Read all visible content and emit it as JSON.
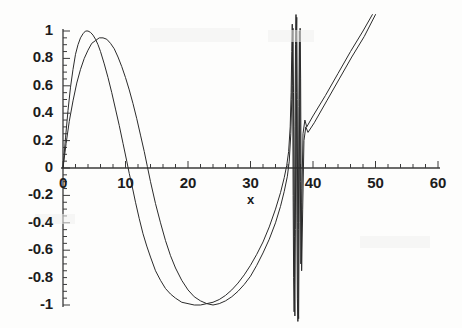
{
  "chart_data": {
    "type": "line",
    "title": "",
    "xlabel": "x",
    "ylabel": "",
    "xlim": [
      -2,
      62
    ],
    "ylim": [
      -1.12,
      1.12
    ],
    "grid": false,
    "legend": null,
    "x_ticks_major": [
      0,
      10,
      20,
      30,
      40,
      50,
      60
    ],
    "x_tick_labels": [
      "0",
      "10",
      "20",
      "30",
      "40",
      "50",
      "60"
    ],
    "x_tick_minor_step": 2,
    "y_ticks_major": [
      1,
      0.8,
      0.6,
      0.4,
      0.2,
      0,
      -0.2,
      -0.4,
      -0.6,
      -0.8,
      -1
    ],
    "y_tick_labels": [
      "1",
      "0.8",
      "0.6",
      "0.4",
      "0.2",
      "0",
      "-0.2",
      "-0.4",
      "-0.6",
      "-0.8",
      "-1"
    ],
    "y_tick_minor_step": 0.05,
    "line_color": "#2b2b2b",
    "line_width": 1.0,
    "axis_color": "#3a3a3a",
    "background_color": "#fdfdfc",
    "series": [
      {
        "name": "curve-1",
        "comment": "chirped oscillation, peaks at 1.00 near x=4.6, trough -1.00 near x=22.5, frequency diverges near x=36-38",
        "points": [
          [
            0.0,
            0.0
          ],
          [
            0.4,
            0.22
          ],
          [
            0.8,
            0.42
          ],
          [
            1.2,
            0.59
          ],
          [
            1.6,
            0.72
          ],
          [
            2.0,
            0.83
          ],
          [
            2.4,
            0.9
          ],
          [
            2.8,
            0.95
          ],
          [
            3.2,
            0.98
          ],
          [
            3.6,
            1.0
          ],
          [
            4.0,
            1.0
          ],
          [
            4.4,
            0.99
          ],
          [
            4.8,
            0.97
          ],
          [
            5.2,
            0.94
          ],
          [
            5.6,
            0.9
          ],
          [
            6.0,
            0.85
          ],
          [
            6.6,
            0.76
          ],
          [
            7.2,
            0.66
          ],
          [
            7.8,
            0.55
          ],
          [
            8.4,
            0.43
          ],
          [
            9.0,
            0.31
          ],
          [
            9.6,
            0.18
          ],
          [
            10.2,
            0.05
          ],
          [
            10.6,
            -0.04
          ],
          [
            11.0,
            -0.12
          ],
          [
            11.6,
            -0.25
          ],
          [
            12.2,
            -0.37
          ],
          [
            12.8,
            -0.48
          ],
          [
            13.4,
            -0.57
          ],
          [
            14.0,
            -0.65
          ],
          [
            14.8,
            -0.75
          ],
          [
            15.6,
            -0.82
          ],
          [
            16.4,
            -0.88
          ],
          [
            17.2,
            -0.92
          ],
          [
            18.0,
            -0.95
          ],
          [
            19.0,
            -0.98
          ],
          [
            20.0,
            -0.99
          ],
          [
            21.0,
            -1.0
          ],
          [
            22.0,
            -1.0
          ],
          [
            23.0,
            -0.99
          ],
          [
            24.0,
            -0.98
          ],
          [
            25.0,
            -0.96
          ],
          [
            26.0,
            -0.93
          ],
          [
            27.0,
            -0.89
          ],
          [
            28.0,
            -0.84
          ],
          [
            29.0,
            -0.78
          ],
          [
            30.0,
            -0.71
          ],
          [
            31.0,
            -0.63
          ],
          [
            32.0,
            -0.54
          ],
          [
            33.0,
            -0.43
          ],
          [
            34.0,
            -0.3
          ],
          [
            34.8,
            -0.18
          ],
          [
            35.4,
            -0.07
          ],
          [
            35.8,
            0.02
          ],
          [
            36.1,
            0.12
          ],
          [
            36.35,
            0.3
          ],
          [
            36.5,
            0.55
          ],
          [
            36.6,
            0.85
          ],
          [
            36.68,
            1.05
          ],
          [
            36.75,
            0.6
          ],
          [
            36.82,
            -0.2
          ],
          [
            36.9,
            -0.8
          ],
          [
            36.98,
            -1.05
          ],
          [
            37.05,
            -0.5
          ],
          [
            37.12,
            0.3
          ],
          [
            37.2,
            0.9
          ],
          [
            37.28,
            1.12
          ],
          [
            37.35,
            0.55
          ],
          [
            37.42,
            -0.35
          ],
          [
            37.5,
            -0.95
          ],
          [
            37.58,
            -1.12
          ],
          [
            37.66,
            -0.45
          ],
          [
            37.74,
            0.45
          ],
          [
            37.82,
            1.0
          ],
          [
            37.9,
            0.7
          ],
          [
            37.98,
            -0.1
          ],
          [
            38.06,
            -0.7
          ],
          [
            38.2,
            -0.25
          ],
          [
            38.4,
            0.25
          ],
          [
            38.7,
            0.35
          ],
          [
            39.0,
            0.3
          ],
          [
            40.0,
            0.38
          ],
          [
            42.0,
            0.53
          ],
          [
            44.0,
            0.69
          ],
          [
            46.0,
            0.85
          ],
          [
            48.0,
            1.0
          ],
          [
            49.5,
            1.12
          ]
        ]
      },
      {
        "name": "curve-2",
        "comment": "companion curve, slightly phase-shifted, peak 0.95 near x=6.2, trough -1.00 near x=23.5",
        "points": [
          [
            0.0,
            0.0
          ],
          [
            0.5,
            0.18
          ],
          [
            1.0,
            0.34
          ],
          [
            1.6,
            0.49
          ],
          [
            2.2,
            0.62
          ],
          [
            2.8,
            0.72
          ],
          [
            3.4,
            0.8
          ],
          [
            4.0,
            0.86
          ],
          [
            4.6,
            0.91
          ],
          [
            5.2,
            0.93
          ],
          [
            5.8,
            0.95
          ],
          [
            6.4,
            0.95
          ],
          [
            7.0,
            0.94
          ],
          [
            7.6,
            0.91
          ],
          [
            8.2,
            0.87
          ],
          [
            8.8,
            0.81
          ],
          [
            9.4,
            0.74
          ],
          [
            10.0,
            0.66
          ],
          [
            10.6,
            0.57
          ],
          [
            11.2,
            0.47
          ],
          [
            11.8,
            0.36
          ],
          [
            12.4,
            0.24
          ],
          [
            13.0,
            0.12
          ],
          [
            13.5,
            0.01
          ],
          [
            14.0,
            -0.1
          ],
          [
            14.8,
            -0.26
          ],
          [
            15.6,
            -0.4
          ],
          [
            16.4,
            -0.53
          ],
          [
            17.2,
            -0.64
          ],
          [
            18.0,
            -0.73
          ],
          [
            19.0,
            -0.82
          ],
          [
            20.0,
            -0.89
          ],
          [
            21.0,
            -0.94
          ],
          [
            22.0,
            -0.97
          ],
          [
            23.0,
            -0.99
          ],
          [
            24.0,
            -1.0
          ],
          [
            25.0,
            -0.99
          ],
          [
            26.0,
            -0.97
          ],
          [
            27.0,
            -0.94
          ],
          [
            28.0,
            -0.9
          ],
          [
            29.0,
            -0.85
          ],
          [
            30.0,
            -0.79
          ],
          [
            31.0,
            -0.71
          ],
          [
            32.0,
            -0.62
          ],
          [
            33.0,
            -0.52
          ],
          [
            34.0,
            -0.4
          ],
          [
            34.8,
            -0.28
          ],
          [
            35.4,
            -0.17
          ],
          [
            35.9,
            -0.06
          ],
          [
            36.2,
            0.05
          ],
          [
            36.45,
            0.25
          ],
          [
            36.6,
            0.5
          ],
          [
            36.72,
            0.82
          ],
          [
            36.8,
            1.02
          ],
          [
            36.88,
            0.55
          ],
          [
            36.95,
            -0.25
          ],
          [
            37.03,
            -0.85
          ],
          [
            37.1,
            -1.08
          ],
          [
            37.18,
            -0.45
          ],
          [
            37.25,
            0.35
          ],
          [
            37.33,
            0.95
          ],
          [
            37.4,
            1.1
          ],
          [
            37.48,
            0.5
          ],
          [
            37.55,
            -0.4
          ],
          [
            37.63,
            -1.0
          ],
          [
            37.7,
            -1.1
          ],
          [
            37.78,
            -0.4
          ],
          [
            37.86,
            0.5
          ],
          [
            37.94,
            1.02
          ],
          [
            38.02,
            0.65
          ],
          [
            38.1,
            -0.15
          ],
          [
            38.18,
            -0.75
          ],
          [
            38.35,
            -0.3
          ],
          [
            38.55,
            0.2
          ],
          [
            38.85,
            0.3
          ],
          [
            39.2,
            0.26
          ],
          [
            40.2,
            0.33
          ],
          [
            42.2,
            0.49
          ],
          [
            44.2,
            0.65
          ],
          [
            46.2,
            0.81
          ],
          [
            48.2,
            0.96
          ],
          [
            50.0,
            1.12
          ]
        ]
      }
    ]
  },
  "axes": {
    "x_axis_name": "x-axis",
    "y_axis_name": "y-axis"
  }
}
